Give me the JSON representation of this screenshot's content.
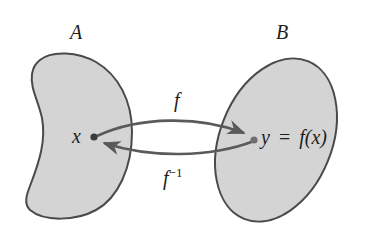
{
  "diagram": {
    "type": "function-inverse-mapping",
    "colors": {
      "set_fill": "#d4d4d4",
      "set_stroke": "#4a4a4a",
      "arrow": "#5a5a5a",
      "point": "#3a3a3a",
      "text": "#1e1e1e",
      "background": "#ffffff"
    },
    "set_a": {
      "label": "A",
      "point_label": "x"
    },
    "set_b": {
      "label": "B",
      "point_label_lhs": "y",
      "point_label_eq": "=",
      "point_label_rhs": "f(x)"
    },
    "arrows": [
      {
        "label": "f",
        "from": "x",
        "to": "y",
        "direction": "A→B"
      },
      {
        "label": "f",
        "superscript": "−1",
        "from": "y",
        "to": "x",
        "direction": "B→A"
      }
    ]
  }
}
